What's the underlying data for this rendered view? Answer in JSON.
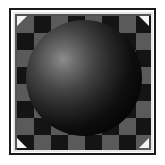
{
  "thumbnail": {
    "description": "Shaded sphere over checkerboard",
    "frame": {
      "outer_border_color": "#1a1a1a",
      "inner_border_color": "#e8e8e8"
    },
    "background": {
      "pattern": "checkerboard",
      "light_tile_color": "#5a5a5a",
      "dark_tile_color": "#141414",
      "tile_size_px": 17
    },
    "sphere": {
      "highlight_color": "#8c8c8c",
      "shadow_color": "#050505"
    },
    "corner_handles": {
      "color": "#f4f4f4",
      "positions": [
        "top-left",
        "top-right",
        "bottom-left",
        "bottom-right"
      ]
    }
  }
}
